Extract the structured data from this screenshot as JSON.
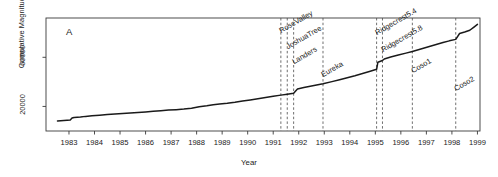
{
  "panel": {
    "label": "A"
  },
  "axes": {
    "y_title": "Cumulative Magnitude",
    "x_title": "Year",
    "y_ticks": [
      "20000",
      "60000"
    ],
    "x_ticks": [
      "1983",
      "1984",
      "1985",
      "1986",
      "1987",
      "1988",
      "1989",
      "1990",
      "1991",
      "1992",
      "1993",
      "1994",
      "1995",
      "1996",
      "1997",
      "1998",
      "1999"
    ]
  },
  "events": [
    {
      "name": "RoseValley",
      "year": 1991.8
    },
    {
      "name": "JoshuaTree",
      "year": 1992.05
    },
    {
      "name": "Landers",
      "year": 1992.3
    },
    {
      "name": "Eureka",
      "year": 1993.45
    },
    {
      "name": "Ridgecrest5.4",
      "year": 1995.55
    },
    {
      "name": "Ridgecrest5.8",
      "year": 1995.78
    },
    {
      "name": "Coso1",
      "year": 1996.95
    },
    {
      "name": "Coso2",
      "year": 1998.65
    }
  ],
  "colors": {
    "axis": "#3a3a3a",
    "curve": "#1a1a1a",
    "event_line": "#4a4a4a"
  },
  "chart_data": {
    "type": "line",
    "title": "",
    "subtitle": "",
    "xlabel": "Year",
    "ylabel": "Cumulative Magnitude",
    "xlim": [
      1982.6,
      1999.6
    ],
    "ylim": [
      0,
      92000
    ],
    "grid": false,
    "legend": null,
    "annotations": [
      {
        "text": "A",
        "type": "panel-label"
      },
      {
        "text": "RoseValley",
        "x": 1991.8,
        "type": "vertical-dashed-line"
      },
      {
        "text": "JoshuaTree",
        "x": 1992.05,
        "type": "vertical-dashed-line"
      },
      {
        "text": "Landers",
        "x": 1992.3,
        "type": "vertical-dashed-line"
      },
      {
        "text": "Eureka",
        "x": 1993.45,
        "type": "vertical-dashed-line"
      },
      {
        "text": "Ridgecrest5.4",
        "x": 1995.55,
        "type": "vertical-dashed-line"
      },
      {
        "text": "Ridgecrest5.8",
        "x": 1995.78,
        "type": "vertical-dashed-line"
      },
      {
        "text": "Coso1",
        "x": 1996.95,
        "type": "vertical-dashed-line"
      },
      {
        "text": "Coso2",
        "x": 1998.65,
        "type": "vertical-dashed-line"
      }
    ],
    "series": [
      {
        "name": "Cumulative Magnitude",
        "x": [
          1983.05,
          1983.3,
          1983.55,
          1983.62,
          1983.7,
          1983.95,
          1984.15,
          1984.4,
          1984.7,
          1985.0,
          1985.3,
          1985.6,
          1985.9,
          1986.2,
          1986.5,
          1986.8,
          1987.1,
          1987.4,
          1987.7,
          1988.0,
          1988.3,
          1988.6,
          1988.9,
          1989.15,
          1989.4,
          1989.7,
          1990.0,
          1990.3,
          1990.6,
          1990.9,
          1991.2,
          1991.5,
          1991.8,
          1992.05,
          1992.3,
          1992.45,
          1992.7,
          1993.0,
          1993.45,
          1993.8,
          1994.1,
          1994.4,
          1994.7,
          1995.0,
          1995.3,
          1995.55,
          1995.6,
          1995.78,
          1995.85,
          1996.1,
          1996.4,
          1996.7,
          1996.95,
          1997.25,
          1997.55,
          1997.85,
          1998.15,
          1998.4,
          1998.65,
          1998.8,
          1999.0,
          1999.2,
          1999.35,
          1999.5
        ],
        "y": [
          8200,
          8600,
          9000,
          10600,
          11000,
          11400,
          11900,
          12400,
          12900,
          13400,
          13800,
          14200,
          14600,
          15000,
          15500,
          16000,
          16500,
          17000,
          17400,
          17900,
          18600,
          19800,
          20600,
          21400,
          22000,
          22600,
          23400,
          24400,
          25300,
          26200,
          27200,
          28200,
          29200,
          30000,
          30800,
          34200,
          35400,
          36600,
          38400,
          40200,
          41800,
          43400,
          45000,
          46800,
          48600,
          50200,
          56000,
          57400,
          58600,
          60200,
          61800,
          63400,
          64800,
          66600,
          68400,
          70200,
          72000,
          73400,
          74600,
          79400,
          80600,
          82000,
          84400,
          86800
        ]
      }
    ]
  }
}
